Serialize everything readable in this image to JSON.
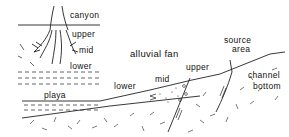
{
  "diagram": {
    "type": "geologic cross-section of an alluvial fan with plan-view inset",
    "inset": {
      "labels": {
        "canyon": "canyon",
        "upper": "upper",
        "mid": "mid",
        "lower": "lower"
      }
    },
    "section": {
      "labels": {
        "playa": "playa",
        "alluvial_fan": "alluvial fan",
        "lower": "lower",
        "mid": "mid",
        "upper": "upper",
        "source_area_line1": "source",
        "source_area_line2": "area",
        "channel_bottom_line1": "channel",
        "channel_bottom_line2": "bottom"
      }
    },
    "colors": {
      "ink": "#111111",
      "background": "#ffffff"
    }
  }
}
